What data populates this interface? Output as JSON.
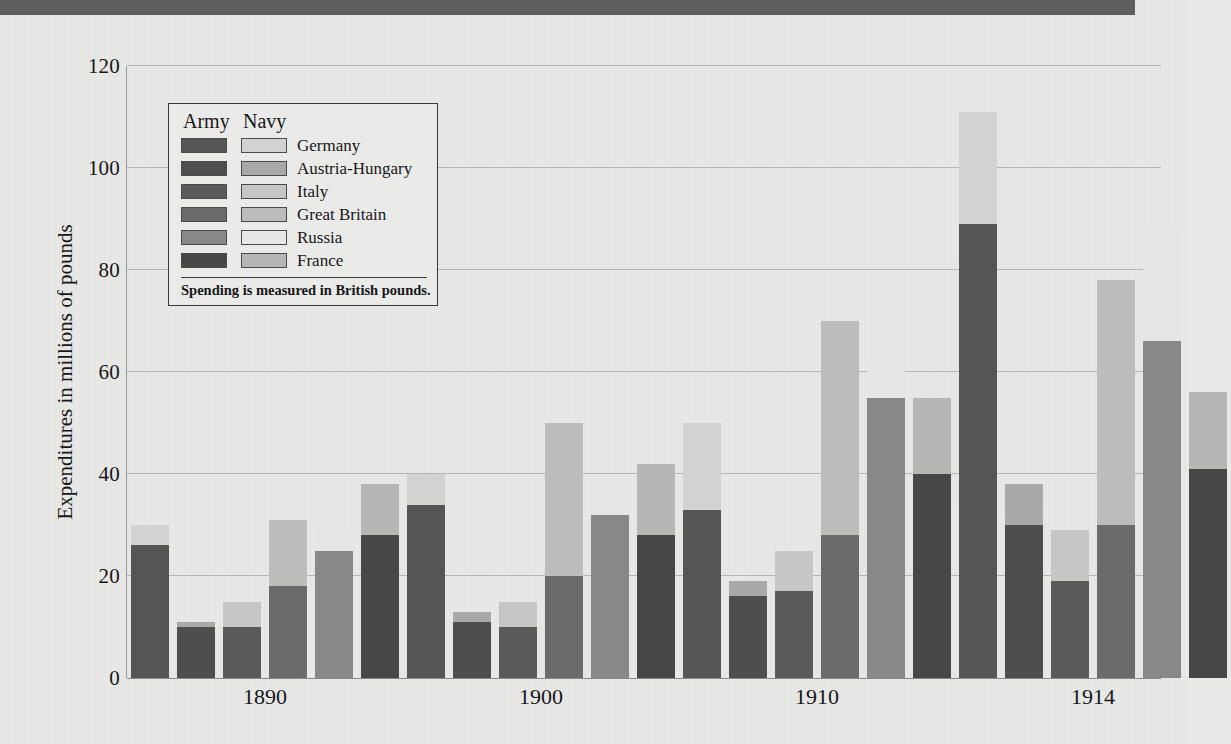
{
  "banner": {
    "color": "#5e5e5e"
  },
  "legend": {
    "header_army": "Army",
    "header_navy": "Navy",
    "note": "Spending is measured in British pounds.",
    "entries": [
      {
        "label": "Germany",
        "army_color": "#555555",
        "navy_color": "#d2d2d0"
      },
      {
        "label": "Austria-Hungary",
        "army_color": "#4e4e4e",
        "navy_color": "#a9a9a7"
      },
      {
        "label": "Italy",
        "army_color": "#5a5a5a",
        "navy_color": "#c6c6c4"
      },
      {
        "label": "Great Britain",
        "army_color": "#6b6b6b",
        "navy_color": "#bcbcba"
      },
      {
        "label": "Russia",
        "army_color": "#888886",
        "navy_color": "#e6e6e4"
      },
      {
        "label": "France",
        "army_color": "#474747",
        "navy_color": "#b6b6b4"
      }
    ]
  },
  "chart_data": {
    "type": "bar",
    "title": "",
    "xlabel": "",
    "ylabel": "Expenditures in millions of pounds",
    "ylim": [
      0,
      120
    ],
    "yticks": [
      0,
      20,
      40,
      60,
      80,
      100,
      120
    ],
    "grid": true,
    "stacked": true,
    "legend_position": "inside-upper-left",
    "categories": [
      "1890",
      "1900",
      "1910",
      "1914"
    ],
    "countries": [
      "Germany",
      "Austria-Hungary",
      "Italy",
      "Great Britain",
      "Russia",
      "France"
    ],
    "series": [
      {
        "name": "Army",
        "values": {
          "Germany": [
            26,
            34,
            33,
            89
          ],
          "Austria-Hungary": [
            10,
            11,
            16,
            30
          ],
          "Italy": [
            10,
            10,
            17,
            19
          ],
          "Great Britain": [
            18,
            20,
            28,
            30
          ],
          "Russia": [
            25,
            32,
            55,
            66
          ],
          "France": [
            28,
            28,
            40,
            41
          ]
        }
      },
      {
        "name": "Navy",
        "values": {
          "Germany": [
            4,
            6,
            17,
            22
          ],
          "Austria-Hungary": [
            1,
            2,
            3,
            8
          ],
          "Italy": [
            5,
            5,
            8,
            10
          ],
          "Great Britain": [
            13,
            30,
            42,
            48
          ],
          "Russia": [
            4,
            6,
            7,
            22
          ],
          "France": [
            10,
            14,
            15,
            15
          ]
        }
      },
      {
        "name": "Total",
        "values": {
          "Germany": [
            30,
            40,
            50,
            111
          ],
          "Austria-Hungary": [
            11,
            13,
            19,
            38
          ],
          "Italy": [
            15,
            15,
            25,
            29
          ],
          "Great Britain": [
            31,
            50,
            70,
            78
          ],
          "Russia": [
            29,
            38,
            62,
            88
          ],
          "France": [
            38,
            42,
            55,
            56
          ]
        }
      }
    ]
  }
}
